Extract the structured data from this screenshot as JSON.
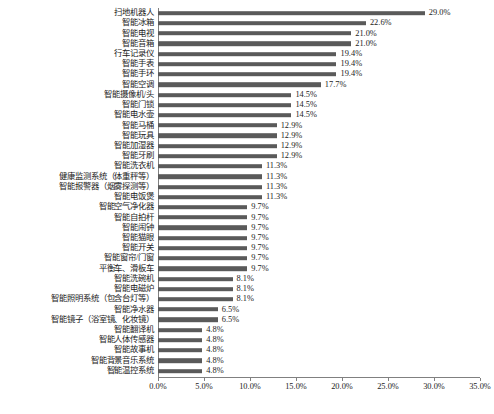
{
  "chart_data": {
    "type": "bar",
    "orientation": "horizontal",
    "title": "",
    "subtitle": "",
    "xlabel": "",
    "ylabel": "",
    "xlim": [
      0,
      35
    ],
    "xticks": [
      "0.0%",
      "5.0%",
      "10.0%",
      "15.0%",
      "20.0%",
      "25.0%",
      "30.0%",
      "35.0%"
    ],
    "xtick_values": [
      0,
      5,
      10,
      15,
      20,
      25,
      30,
      35
    ],
    "grid": false,
    "legend": null,
    "bar_color": "#5a5a5a",
    "axis_color": "#808080",
    "categories": [
      "扫地机器人",
      "智能冰箱",
      "智能电视",
      "智能音箱",
      "行车记录仪",
      "智能手表",
      "智能手环",
      "智能空调",
      "智能摄像机/头",
      "智能门锁",
      "智能电水壶",
      "智能马桶",
      "智能玩具",
      "智能加湿器",
      "智能牙刷",
      "智能洗衣机",
      "健康监测系统（体重秤等）",
      "智能报警器（烟雾探测等）",
      "智能电饭煲",
      "智能空气净化器",
      "智能自拍杆",
      "智能闹钟",
      "智能猫眼",
      "智能开关",
      "智能窗帘/门窗",
      "平衡车、滑板车",
      "智能洗碗机",
      "智能电磁炉",
      "智能照明系统（包含台灯等）",
      "智能净水器",
      "智能镜子（浴室镜、化妆镜）",
      "智能翻译机",
      "智能人体传感器",
      "智能故事机",
      "智能背景音乐系统",
      "智能温控系统"
    ],
    "values": [
      29.0,
      22.6,
      21.0,
      21.0,
      19.4,
      19.4,
      19.4,
      17.7,
      14.5,
      14.5,
      14.5,
      12.9,
      12.9,
      12.9,
      12.9,
      11.3,
      11.3,
      11.3,
      11.3,
      9.7,
      9.7,
      9.7,
      9.7,
      9.7,
      9.7,
      9.7,
      8.1,
      8.1,
      8.1,
      6.5,
      6.5,
      4.8,
      4.8,
      4.8,
      4.8,
      4.8
    ],
    "value_labels": [
      "29.0%",
      "22.6%",
      "21.0%",
      "21.0%",
      "19.4%",
      "19.4%",
      "19.4%",
      "17.7%",
      "14.5%",
      "14.5%",
      "14.5%",
      "12.9%",
      "12.9%",
      "12.9%",
      "12.9%",
      "11.3%",
      "11.3%",
      "11.3%",
      "11.3%",
      "9.7%",
      "9.7%",
      "9.7%",
      "9.7%",
      "9.7%",
      "9.7%",
      "9.7%",
      "8.1%",
      "8.1%",
      "8.1%",
      "6.5%",
      "6.5%",
      "4.8%",
      "4.8%",
      "4.8%",
      "4.8%",
      "4.8%"
    ]
  }
}
